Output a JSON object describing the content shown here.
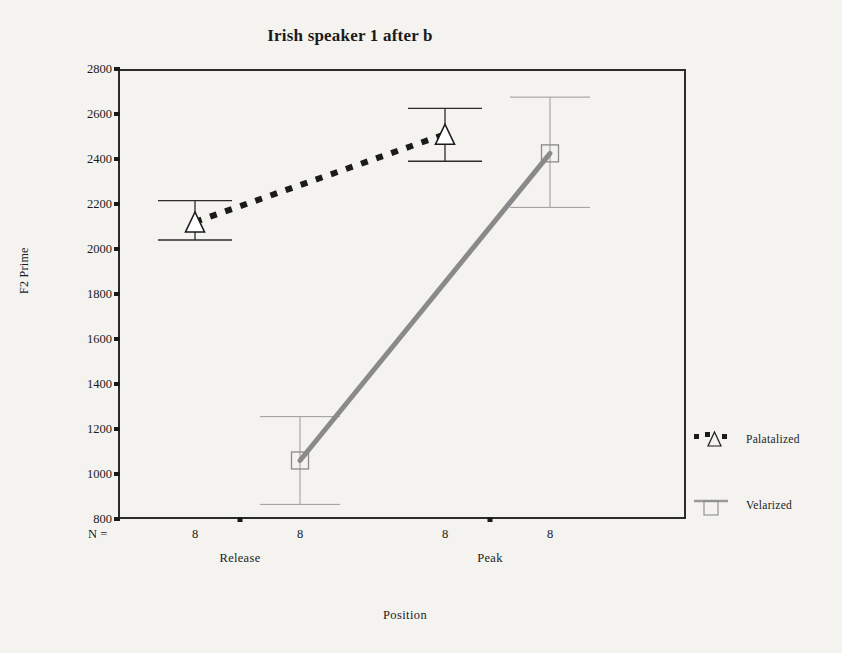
{
  "chart_data": {
    "type": "line",
    "title": "Irish speaker 1 after b",
    "xlabel": "Position",
    "ylabel": "F2 Prime",
    "categories": [
      "Release",
      "Peak"
    ],
    "ylim": [
      800,
      2800
    ],
    "ytick_labels": [
      "2800",
      "2600",
      "2400",
      "2200",
      "2000",
      "1800",
      "1600",
      "1400",
      "1200",
      "1000",
      "800"
    ],
    "yticks": [
      2800,
      2600,
      2400,
      2200,
      2000,
      1800,
      1600,
      1400,
      1200,
      1000,
      800
    ],
    "grid": false,
    "legend_position": "right",
    "n_label": "N =",
    "n_values": [
      "8",
      "8",
      "8",
      "8"
    ],
    "series": [
      {
        "name": "Palatalized",
        "marker": "triangle",
        "linestyle": "dotted",
        "color": "#1b1b1b",
        "values": [
          2120,
          2510
        ],
        "error_upper": [
          2215,
          2625
        ],
        "error_lower": [
          2040,
          2390
        ]
      },
      {
        "name": "Velarized",
        "marker": "square",
        "linestyle": "solid",
        "color": "#8a8a8a",
        "values": [
          1060,
          2425
        ],
        "error_upper": [
          1255,
          2675
        ],
        "error_lower": [
          865,
          2185
        ]
      }
    ]
  },
  "legend": {
    "items": [
      {
        "label": "Palatalized"
      },
      {
        "label": "Velarized"
      }
    ]
  }
}
